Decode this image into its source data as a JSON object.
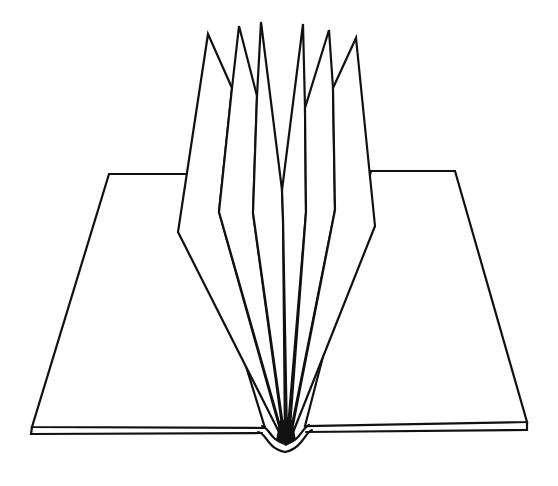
{
  "figure": {
    "title": "Open book with fanned pages",
    "colors": {
      "background": "#ffffff",
      "stroke": "#111111"
    }
  },
  "parts": {
    "left_cover": "left-board",
    "right_cover": "right-board",
    "spine": "spine-curve",
    "signatures": [
      "page-1",
      "page-2",
      "page-3",
      "page-4",
      "page-5",
      "page-6",
      "page-7"
    ]
  }
}
